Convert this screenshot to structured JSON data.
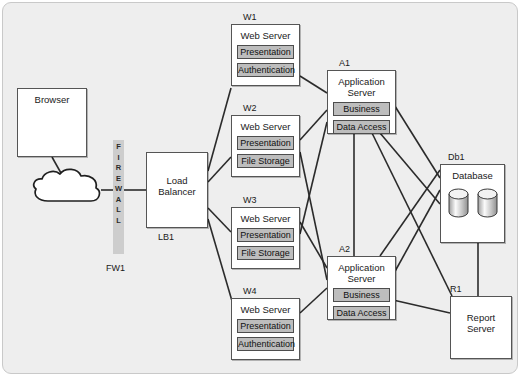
{
  "diagram": {
    "background_color": "#eeeeee",
    "component_fill": "#bdbdbd",
    "node_fill": "#ffffff"
  },
  "nodes": {
    "browser": {
      "tag": "",
      "title": "Browser"
    },
    "cloud": {
      "tag": "",
      "title": ""
    },
    "firewall": {
      "tag": "FW1",
      "letters": [
        "F",
        "I",
        "R",
        "E",
        "W",
        "A",
        "L",
        "L"
      ]
    },
    "load_balancer": {
      "tag": "LB1",
      "title": "Load\nBalancer"
    },
    "w1": {
      "tag": "W1",
      "title": "Web Server",
      "components": [
        "Presentation",
        "Authentication"
      ]
    },
    "w2": {
      "tag": "W2",
      "title": "Web Server",
      "components": [
        "Presentation",
        "File Storage"
      ]
    },
    "w3": {
      "tag": "W3",
      "title": "Web Server",
      "components": [
        "Presentation",
        "File Storage"
      ]
    },
    "w4": {
      "tag": "W4",
      "title": "Web Server",
      "components": [
        "Presentation",
        "Authentication"
      ]
    },
    "a1": {
      "tag": "A1",
      "title": "Application\nServer",
      "components": [
        "Business",
        "Data Access"
      ]
    },
    "a2": {
      "tag": "A2",
      "title": "Application\nServer",
      "components": [
        "Business",
        "Data Access"
      ]
    },
    "db1": {
      "tag": "Db1",
      "title": "Database"
    },
    "r1": {
      "tag": "R1",
      "title": "Report\nServer"
    }
  },
  "connections": [
    {
      "from": "browser",
      "to": "cloud"
    },
    {
      "from": "cloud",
      "to": "firewall"
    },
    {
      "from": "firewall",
      "to": "load_balancer"
    },
    {
      "from": "load_balancer",
      "to": "w1"
    },
    {
      "from": "load_balancer",
      "to": "w2"
    },
    {
      "from": "load_balancer",
      "to": "w3"
    },
    {
      "from": "load_balancer",
      "to": "w4"
    },
    {
      "from": "w1",
      "to": "a1"
    },
    {
      "from": "w2",
      "to": "a1"
    },
    {
      "from": "w3",
      "to": "a1"
    },
    {
      "from": "w4",
      "to": "a1"
    },
    {
      "from": "w1",
      "to": "a2"
    },
    {
      "from": "w2",
      "to": "a2"
    },
    {
      "from": "w3",
      "to": "a2"
    },
    {
      "from": "w4",
      "to": "a2"
    },
    {
      "from": "a1",
      "to": "a2"
    },
    {
      "from": "a1",
      "to": "db1"
    },
    {
      "from": "a2",
      "to": "db1"
    },
    {
      "from": "a1",
      "to": "r1"
    },
    {
      "from": "a2",
      "to": "r1"
    },
    {
      "from": "db1",
      "to": "r1"
    }
  ]
}
